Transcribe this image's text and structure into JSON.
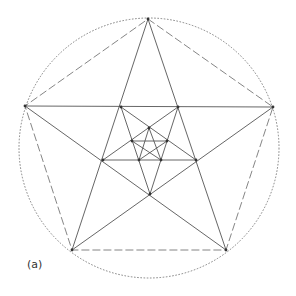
{
  "figure": {
    "label": "(a)",
    "colors": {
      "line": "#555555",
      "vertex": "#333333",
      "background": "#ffffff"
    },
    "circumcircle": {
      "cx": 149,
      "cy": 148,
      "r": 130,
      "style": "dotted"
    },
    "outer_pentagon": {
      "style": "dashed",
      "points": [
        [
          148,
          19
        ],
        [
          273,
          107
        ],
        [
          226,
          250
        ],
        [
          72,
          250
        ],
        [
          25,
          106
        ]
      ]
    },
    "outer_pentagram": {
      "style": "solid",
      "points": [
        [
          148,
          19
        ],
        [
          226,
          250
        ],
        [
          25,
          106
        ],
        [
          273,
          107
        ],
        [
          72,
          250
        ]
      ]
    },
    "inner_pentagon_1": {
      "points": [
        [
          121,
          107
        ],
        [
          178,
          107
        ],
        [
          196,
          160
        ],
        [
          150,
          194
        ],
        [
          103,
          160
        ]
      ]
    },
    "inner_pentagram_1": {
      "style": "solid",
      "points": [
        [
          121,
          107
        ],
        [
          196,
          160
        ],
        [
          103,
          160
        ],
        [
          178,
          107
        ],
        [
          150,
          194
        ]
      ]
    },
    "inner_pentagon_2": {
      "points": [
        [
          149,
          128
        ],
        [
          167,
          141
        ],
        [
          161,
          160
        ],
        [
          139,
          160
        ],
        [
          132,
          141
        ]
      ]
    },
    "inner_pentagram_2": {
      "style": "solid",
      "points": [
        [
          149,
          128
        ],
        [
          161,
          160
        ],
        [
          132,
          141
        ],
        [
          167,
          141
        ],
        [
          139,
          160
        ]
      ]
    }
  }
}
